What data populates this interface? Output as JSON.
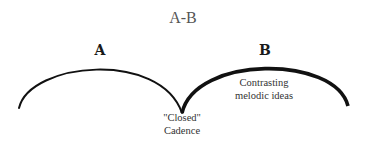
{
  "diagram": {
    "title": "A-B",
    "sections": [
      {
        "label": "A",
        "description": ""
      },
      {
        "label": "B",
        "description_line1": "Contrasting",
        "description_line2": "melodic ideas"
      }
    ],
    "junction": {
      "line1": "\"Closed\"",
      "line2": "Cadence"
    },
    "colors": {
      "stroke": "#111111",
      "title": "#555555",
      "text": "#333333"
    }
  }
}
